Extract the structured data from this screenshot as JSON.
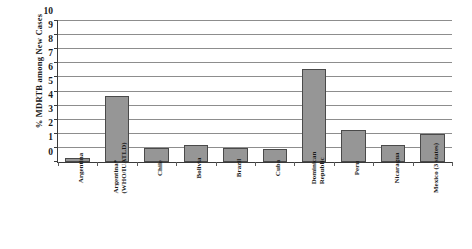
{
  "chart_data": {
    "type": "bar",
    "title": "",
    "xlabel": "",
    "ylabel": "% MDRTB among New Cases",
    "ylim": [
      0,
      10
    ],
    "ytick_step": 1,
    "grid": true,
    "legend": "none",
    "bar_color": "#969696",
    "bar_border_color": "#4a4a4a",
    "gridline_color": "#8d8d8d",
    "axis_color": "#3a3a3a",
    "categories": [
      "Argentina",
      "Argentina* (WHO/IUATLD)",
      "Chile",
      "Bolivia",
      "Brazil",
      "Cuba",
      "Dominican Republic",
      "Peru",
      "Nicaragua",
      "Mexico (3 states)"
    ],
    "category_lines": [
      [
        "Argentina"
      ],
      [
        "Argentina*",
        "(WHO/IUATLD)"
      ],
      [
        "Chile"
      ],
      [
        "Bolivia"
      ],
      [
        "Brazil"
      ],
      [
        "Cuba"
      ],
      [
        "Dominican",
        "Republic"
      ],
      [
        "Peru"
      ],
      [
        "Nicaragua"
      ],
      [
        "Mexico (3 states)"
      ]
    ],
    "values": [
      0.3,
      4.7,
      1.0,
      1.2,
      1.0,
      0.9,
      6.6,
      2.3,
      1.2,
      2.0
    ],
    "ytick_labels": [
      "0",
      "1",
      "2",
      "3",
      "4",
      "5",
      "6",
      "7",
      "8",
      "9",
      "10"
    ]
  }
}
